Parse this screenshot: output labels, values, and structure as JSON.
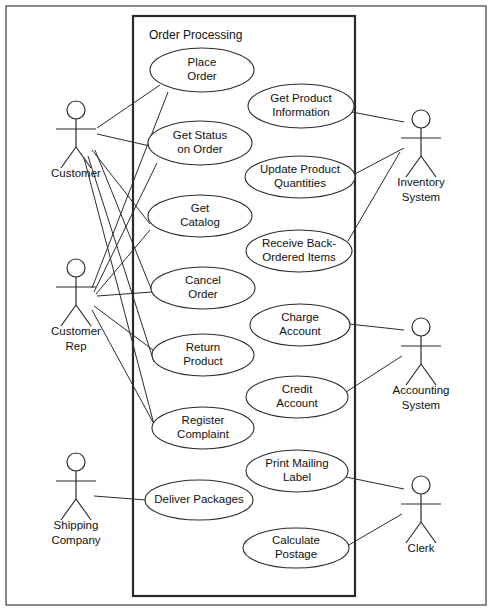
{
  "diagram": {
    "kind": "uml-use-case-diagram",
    "system": {
      "title": "Order Processing",
      "box": {
        "x": 133,
        "y": 16,
        "w": 222,
        "h": 580
      }
    },
    "frame": {
      "x": 6,
      "y": 6,
      "w": 480,
      "h": 599
    },
    "use_cases": [
      {
        "id": "place-order",
        "lines": [
          "Place",
          "Order"
        ],
        "cx": 202,
        "cy": 70,
        "rx": 52,
        "ry": 22
      },
      {
        "id": "get-product-info",
        "lines": [
          "Get Product",
          "Information"
        ],
        "cx": 301,
        "cy": 106,
        "rx": 53,
        "ry": 22
      },
      {
        "id": "get-status-on-order",
        "lines": [
          "Get Status",
          "on Order"
        ],
        "cx": 200,
        "cy": 143,
        "rx": 52,
        "ry": 22
      },
      {
        "id": "update-product-qty",
        "lines": [
          "Update Product",
          "Quantities"
        ],
        "cx": 300,
        "cy": 177,
        "rx": 55,
        "ry": 21
      },
      {
        "id": "get-catalog",
        "lines": [
          "Get",
          "Catalog"
        ],
        "cx": 200,
        "cy": 216,
        "rx": 52,
        "ry": 21
      },
      {
        "id": "receive-back-ordered",
        "lines": [
          "Receive Back-",
          "Ordered Items"
        ],
        "cx": 299,
        "cy": 251,
        "rx": 53,
        "ry": 21
      },
      {
        "id": "cancel-order",
        "lines": [
          "Cancel",
          "Order"
        ],
        "cx": 203,
        "cy": 288,
        "rx": 52,
        "ry": 21
      },
      {
        "id": "charge-account",
        "lines": [
          "Charge",
          "Account"
        ],
        "cx": 300,
        "cy": 325,
        "rx": 50,
        "ry": 21
      },
      {
        "id": "return-product",
        "lines": [
          "Return",
          "Product"
        ],
        "cx": 203,
        "cy": 355,
        "rx": 51,
        "ry": 21
      },
      {
        "id": "credit-account",
        "lines": [
          "Credit",
          "Account"
        ],
        "cx": 297,
        "cy": 397,
        "rx": 51,
        "ry": 21
      },
      {
        "id": "register-complaint",
        "lines": [
          "Register",
          "Complaint"
        ],
        "cx": 203,
        "cy": 428,
        "rx": 51,
        "ry": 21
      },
      {
        "id": "print-mailing-label",
        "lines": [
          "Print Mailing",
          "Label"
        ],
        "cx": 297,
        "cy": 471,
        "rx": 51,
        "ry": 21
      },
      {
        "id": "deliver-packages",
        "lines": [
          "Deliver Packages"
        ],
        "cx": 199,
        "cy": 500,
        "rx": 54,
        "ry": 20
      },
      {
        "id": "calculate-postage",
        "lines": [
          "Calculate",
          "Postage"
        ],
        "cx": 296,
        "cy": 548,
        "rx": 53,
        "ry": 20
      }
    ],
    "actors": [
      {
        "id": "customer",
        "lines": [
          "Customer"
        ],
        "x": 76,
        "y": 110,
        "label_y": 174
      },
      {
        "id": "customer-rep",
        "lines": [
          "Customer",
          "Rep"
        ],
        "x": 76,
        "y": 268,
        "label_y": 332
      },
      {
        "id": "shipping-company",
        "lines": [
          "Shipping",
          "Company"
        ],
        "x": 76,
        "y": 462,
        "label_y": 526
      },
      {
        "id": "inventory-system",
        "lines": [
          "Inventory",
          "System"
        ],
        "x": 421,
        "y": 119,
        "label_y": 183
      },
      {
        "id": "accounting-system",
        "lines": [
          "Accounting",
          "System"
        ],
        "x": 421,
        "y": 327,
        "label_y": 391
      },
      {
        "id": "clerk",
        "lines": [
          "Clerk"
        ],
        "x": 421,
        "y": 485,
        "label_y": 549
      }
    ],
    "associations": [
      {
        "from": "customer",
        "to": "place-order",
        "x1": 97,
        "y1": 128,
        "x2": 160,
        "y2": 85
      },
      {
        "from": "customer",
        "to": "get-status-on-order",
        "x1": 97,
        "y1": 134,
        "x2": 150,
        "y2": 146
      },
      {
        "from": "customer",
        "to": "get-catalog",
        "x1": 92,
        "y1": 150,
        "x2": 150,
        "y2": 224
      },
      {
        "from": "customer",
        "to": "cancel-order",
        "x1": 95,
        "y1": 150,
        "x2": 154,
        "y2": 296
      },
      {
        "from": "customer",
        "to": "return-product",
        "x1": 88,
        "y1": 156,
        "x2": 154,
        "y2": 362
      },
      {
        "from": "customer",
        "to": "register-complaint",
        "x1": 84,
        "y1": 158,
        "x2": 156,
        "y2": 432
      },
      {
        "from": "customer-rep",
        "to": "place-order",
        "x1": 92,
        "y1": 288,
        "x2": 168,
        "y2": 92
      },
      {
        "from": "customer-rep",
        "to": "get-status-on-order",
        "x1": 94,
        "y1": 292,
        "x2": 157,
        "y2": 163
      },
      {
        "from": "customer-rep",
        "to": "get-catalog",
        "x1": 96,
        "y1": 294,
        "x2": 150,
        "y2": 230
      },
      {
        "from": "customer-rep",
        "to": "cancel-order",
        "x1": 97,
        "y1": 296,
        "x2": 152,
        "y2": 292
      },
      {
        "from": "customer-rep",
        "to": "return-product",
        "x1": 94,
        "y1": 306,
        "x2": 153,
        "y2": 350
      },
      {
        "from": "customer-rep",
        "to": "register-complaint",
        "x1": 92,
        "y1": 310,
        "x2": 154,
        "y2": 424
      },
      {
        "from": "shipping-company",
        "to": "deliver-packages",
        "x1": 94,
        "y1": 496,
        "x2": 146,
        "y2": 500
      },
      {
        "from": "inventory-system",
        "to": "get-product-info",
        "x1": 404,
        "y1": 122,
        "x2": 352,
        "y2": 112
      },
      {
        "from": "inventory-system",
        "to": "update-product-qty",
        "x1": 404,
        "y1": 148,
        "x2": 353,
        "y2": 175
      },
      {
        "from": "inventory-system",
        "to": "receive-back-ordered",
        "x1": 400,
        "y1": 152,
        "x2": 348,
        "y2": 241
      },
      {
        "from": "accounting-system",
        "to": "charge-account",
        "x1": 404,
        "y1": 330,
        "x2": 349,
        "y2": 324
      },
      {
        "from": "accounting-system",
        "to": "credit-account",
        "x1": 402,
        "y1": 356,
        "x2": 346,
        "y2": 392
      },
      {
        "from": "clerk",
        "to": "print-mailing-label",
        "x1": 404,
        "y1": 489,
        "x2": 346,
        "y2": 477
      },
      {
        "from": "clerk",
        "to": "calculate-postage",
        "x1": 402,
        "y1": 514,
        "x2": 347,
        "y2": 546
      }
    ]
  }
}
